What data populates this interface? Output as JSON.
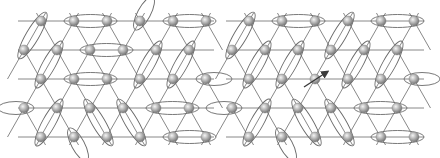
{
  "figure": {
    "colors": {
      "bond": "#7a7a7a",
      "dimer": "#6a6a6a",
      "atom_light": "#e8e8e8",
      "atom_dark": "#7c7c7c",
      "arrow": "#3a3a3a",
      "background": "#ffffff"
    },
    "rows_y": [
      21,
      50,
      79,
      108,
      137
    ],
    "panels": [
      {
        "name": "left-panel",
        "x_range": [
          18,
          214
        ],
        "even_row_x": [
          41,
          74,
          107,
          140,
          173,
          206
        ],
        "odd_row_x": [
          24,
          57,
          90,
          123,
          156,
          189
        ],
        "dimers": [
          [
            [
              41,
              21
            ],
            [
              24,
              50
            ]
          ],
          [
            [
              74,
              21
            ],
            [
              107,
              21
            ]
          ],
          [
            [
              173,
              21
            ],
            [
              206,
              21
            ]
          ],
          [
            [
              57,
              50
            ],
            [
              41,
              79
            ]
          ],
          [
            [
              90,
              50
            ],
            [
              123,
              50
            ]
          ],
          [
            [
              156,
              50
            ],
            [
              140,
              79
            ]
          ],
          [
            [
              189,
              50
            ],
            [
              173,
              79
            ]
          ],
          [
            [
              74,
              79
            ],
            [
              107,
              79
            ]
          ],
          [
            [
              57,
              108
            ],
            [
              41,
              137
            ]
          ],
          [
            [
              90,
              108
            ],
            [
              107,
              137
            ]
          ],
          [
            [
              123,
              108
            ],
            [
              140,
              137
            ]
          ],
          [
            [
              156,
              108
            ],
            [
              189,
              108
            ]
          ],
          [
            [
              173,
              137
            ],
            [
              206,
              137
            ]
          ]
        ],
        "edge_dimers": [
          [
            [
              140,
              21
            ],
            [
              148,
              6
            ]
          ],
          [
            [
              206,
              79
            ],
            [
              222,
              79
            ]
          ],
          [
            [
              24,
              108
            ],
            [
              8,
              108
            ]
          ],
          [
            [
              74,
              137
            ],
            [
              82,
              152
            ]
          ]
        ],
        "spin": null
      },
      {
        "name": "right-panel",
        "x_range": [
          226,
          424
        ],
        "even_row_x": [
          249,
          282,
          315,
          348,
          381,
          414
        ],
        "odd_row_x": [
          232,
          265,
          298,
          331,
          364,
          397
        ],
        "dimers": [
          [
            [
              249,
              21
            ],
            [
              232,
              50
            ]
          ],
          [
            [
              282,
              21
            ],
            [
              315,
              21
            ]
          ],
          [
            [
              348,
              21
            ],
            [
              331,
              50
            ]
          ],
          [
            [
              381,
              21
            ],
            [
              414,
              21
            ]
          ],
          [
            [
              265,
              50
            ],
            [
              249,
              79
            ]
          ],
          [
            [
              298,
              50
            ],
            [
              282,
              79
            ]
          ],
          [
            [
              364,
              50
            ],
            [
              348,
              79
            ]
          ],
          [
            [
              397,
              50
            ],
            [
              381,
              79
            ]
          ],
          [
            [
              265,
              108
            ],
            [
              249,
              137
            ]
          ],
          [
            [
              298,
              108
            ],
            [
              315,
              137
            ]
          ],
          [
            [
              331,
              108
            ],
            [
              348,
              137
            ]
          ],
          [
            [
              364,
              108
            ],
            [
              397,
              108
            ]
          ],
          [
            [
              381,
              137
            ],
            [
              414,
              137
            ]
          ]
        ],
        "edge_dimers": [
          [
            [
              414,
              79
            ],
            [
              430,
              79
            ]
          ],
          [
            [
              232,
              108
            ],
            [
              216,
              108
            ]
          ],
          [
            [
              282,
              137
            ],
            [
              290,
              152
            ]
          ]
        ],
        "spin": {
          "site": [
            315,
            79
          ],
          "arrow_from": [
            304,
            87
          ],
          "arrow_to": [
            327,
            72
          ]
        }
      }
    ]
  }
}
